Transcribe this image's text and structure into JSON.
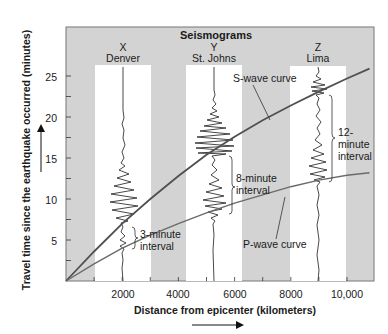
{
  "chart_data": {
    "type": "line",
    "title": "Seismograms",
    "xlabel": "Distance from epicenter (kilometers)",
    "ylabel": "Travel time since the earthquake occurred (minutes)",
    "xlim": [
      0,
      10800
    ],
    "ylim": [
      0,
      29
    ],
    "xticks": [
      2000,
      4000,
      6000,
      8000,
      10000
    ],
    "xtick_labels": [
      "2000",
      "4000",
      "6000",
      "8000",
      "10,000"
    ],
    "xminor_ticks": [
      1000,
      3000,
      5000,
      7000,
      9000
    ],
    "yticks": [
      5,
      10,
      15,
      20,
      25
    ],
    "yminor_ticks": [
      2.5,
      7.5,
      12.5,
      17.5,
      22.5
    ],
    "series": [
      {
        "name": "S-wave curve",
        "color": "#505050",
        "x": [
          0,
          1000,
          2000,
          3000,
          4000,
          5000,
          6000,
          7000,
          8000,
          9000,
          10000,
          10800
        ],
        "y": [
          0,
          3.6,
          7.0,
          10.0,
          12.8,
          15.4,
          17.6,
          19.6,
          21.4,
          23.1,
          24.7,
          25.9
        ]
      },
      {
        "name": "P-wave curve",
        "color": "#6a6a6a",
        "x": [
          0,
          1000,
          2000,
          3000,
          4000,
          5000,
          6000,
          7000,
          8000,
          9000,
          10000,
          10800
        ],
        "y": [
          0,
          2.1,
          4.0,
          5.6,
          7.0,
          8.3,
          9.5,
          10.5,
          11.5,
          12.3,
          12.9,
          13.2
        ]
      }
    ],
    "stations": [
      {
        "letter": "X",
        "name": "Denver",
        "distance_km": 2000,
        "p_arrival_min": 4,
        "s_arrival_min": 7,
        "interval_label": "3-minute\ninterval",
        "interval_min": 3
      },
      {
        "letter": "Y",
        "name": "St. Johns",
        "distance_km": 5100,
        "p_arrival_min": 7.5,
        "s_arrival_min": 15.5,
        "interval_label": "8-minute\ninterval",
        "interval_min": 8
      },
      {
        "letter": "Z",
        "name": "Lima",
        "distance_km": 9000,
        "p_arrival_min": 11.5,
        "s_arrival_min": 23.3,
        "interval_label": "12-\nminute\ninterval",
        "interval_min": 12
      }
    ],
    "annotations": [
      "S-wave curve",
      "P-wave curve",
      "3-minute interval",
      "8-minute interval",
      "12-minute interval"
    ],
    "background_bands": [
      {
        "from_km": 1000,
        "to_km": 3000,
        "color": "#ffffff"
      },
      {
        "from_km": 4200,
        "to_km": 6100,
        "color": "#ffffff"
      },
      {
        "from_km": 8000,
        "to_km": 10000,
        "color": "#ffffff"
      }
    ],
    "grid": false,
    "legend": "none"
  },
  "labels": {
    "title": "Seismograms",
    "station_x_letter": "X",
    "station_x_name": "Denver",
    "station_y_letter": "Y",
    "station_y_name": "St. Johns",
    "station_z_letter": "Z",
    "station_z_name": "Lima",
    "s_curve": "S-wave curve",
    "p_curve": "P-wave curve",
    "interval_3_line1": "3-minute",
    "interval_3_line2": "interval",
    "interval_8_line1": "8-minute",
    "interval_8_line2": "interval",
    "interval_12_line1": "12-",
    "interval_12_line2": "minute",
    "interval_12_line3": "interval",
    "xlabel": "Distance from epicenter (kilometers)",
    "ylabel": "Travel time since the earthquake occurred (minutes)",
    "xtick_2000": "2000",
    "xtick_4000": "4000",
    "xtick_6000": "6000",
    "xtick_8000": "8000",
    "xtick_10000": "10,000",
    "ytick_5": "5",
    "ytick_10": "10",
    "ytick_15": "15",
    "ytick_20": "20",
    "ytick_25": "25"
  },
  "colors": {
    "panel_gray": "#d3d3d3",
    "band_white": "#ffffff",
    "s_curve": "#505050",
    "p_curve": "#6a6a6a",
    "trace": "#1a1a1a"
  }
}
